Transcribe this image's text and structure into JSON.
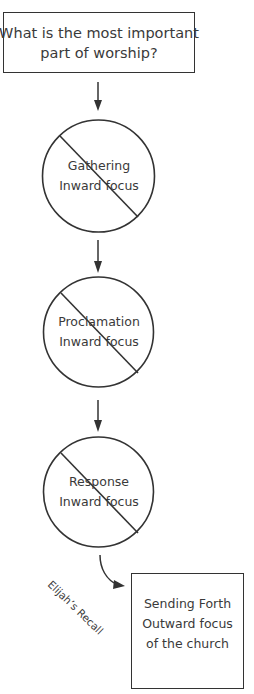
{
  "diagram": {
    "title_box": {
      "lines": [
        "What is the most important",
        "part of worship?"
      ]
    },
    "steps": [
      {
        "name": "Gathering",
        "focus": "Inward focus",
        "crossed_out": true
      },
      {
        "name": "Proclamation",
        "focus": "Inward focus",
        "crossed_out": true
      },
      {
        "name": "Response",
        "focus": "Inward focus",
        "crossed_out": true
      }
    ],
    "transition_label": "Elijah’s Recall",
    "result_box": {
      "lines": [
        "Sending Forth",
        "Outward focus",
        "of the church"
      ]
    },
    "colors": {
      "stroke": "#333333",
      "text": "#3a3a3a",
      "background": "#ffffff"
    }
  }
}
